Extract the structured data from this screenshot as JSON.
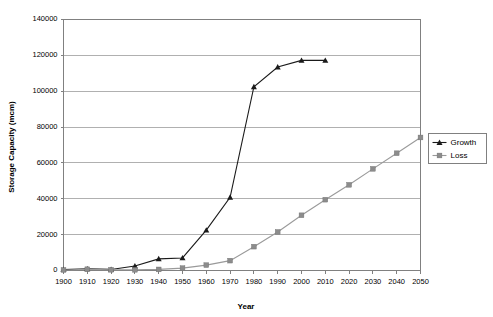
{
  "chart_data": {
    "type": "line",
    "title": "",
    "xlabel": "Year",
    "ylabel": "Storage Capacity (mcm)",
    "x": [
      1900,
      1910,
      1920,
      1930,
      1940,
      1950,
      1960,
      1970,
      1980,
      1990,
      2000,
      2010,
      2020,
      2030,
      2040,
      2050
    ],
    "xtick_labels": [
      "1900",
      "1910",
      "1920",
      "1930",
      "1940",
      "1950",
      "1960",
      "1970",
      "1980",
      "1990",
      "2000",
      "2010",
      "2020",
      "2030",
      "2040",
      "2050"
    ],
    "ytick_labels": [
      "0",
      "20000",
      "40000",
      "60000",
      "80000",
      "100000",
      "120000",
      "140000"
    ],
    "yticks": [
      0,
      20000,
      40000,
      60000,
      80000,
      100000,
      120000,
      140000
    ],
    "xlim": [
      1900,
      2050
    ],
    "ylim": [
      0,
      140000
    ],
    "grid": "horizontal",
    "legend_position": "right",
    "series": [
      {
        "name": "Growth",
        "color": "#1a1a1a",
        "marker": "triangle",
        "x": [
          1900,
          1910,
          1920,
          1930,
          1940,
          1950,
          1960,
          1970,
          1980,
          1990,
          2000,
          2010
        ],
        "values": [
          500,
          900,
          600,
          2500,
          6500,
          7000,
          22500,
          40800,
          102500,
          113500,
          117200,
          117200
        ]
      },
      {
        "name": "Loss",
        "color": "#8c8c8c",
        "marker": "square",
        "x": [
          1900,
          1910,
          1920,
          1930,
          1940,
          1950,
          1960,
          1970,
          1980,
          1990,
          2000,
          2010,
          2020,
          2030,
          2040,
          2050
        ],
        "values": [
          300,
          700,
          400,
          400,
          600,
          1300,
          3000,
          5500,
          13300,
          21500,
          30800,
          39500,
          47800,
          56700,
          65400,
          74200
        ]
      }
    ]
  },
  "legend": {
    "items": [
      {
        "label": "Growth"
      },
      {
        "label": "Loss"
      }
    ]
  }
}
